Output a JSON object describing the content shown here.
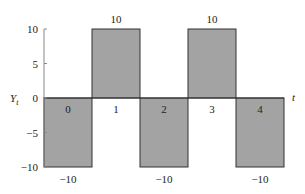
{
  "chart_data": {
    "type": "bar",
    "title": "",
    "xlabel": "t",
    "ylabel": "Y_t",
    "ylim": [
      -10,
      10
    ],
    "yticks": [
      10,
      5,
      0,
      -5,
      -10
    ],
    "ytick_labels": [
      "10",
      "5",
      "0",
      "−5",
      "−10"
    ],
    "categories": [
      "0",
      "1",
      "2",
      "3",
      "4"
    ],
    "values": [
      -10,
      10,
      -10,
      10,
      -10
    ],
    "value_labels": [
      "−10",
      "10",
      "−10",
      "10",
      "−10"
    ],
    "bar_color": "#a3a3a3",
    "bar_edge_color": "#333333",
    "grid": false,
    "legend": null
  },
  "axis": {
    "y_label_main": "Y",
    "y_label_sub": "t",
    "x_label": "t"
  }
}
